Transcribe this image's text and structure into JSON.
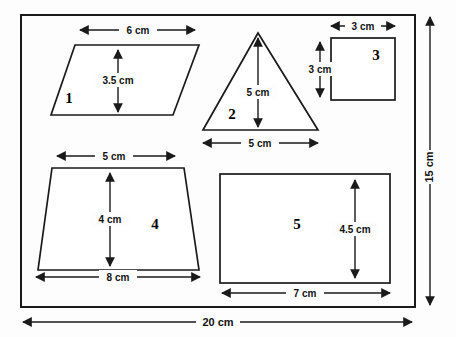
{
  "units": "cm",
  "frame": {
    "name": "outer-bounding-rectangle",
    "width_label": "20 cm",
    "height_label": "15 cm",
    "width_value": 20,
    "height_value": 15
  },
  "shapes": [
    {
      "id": 1,
      "number_label": "1",
      "kind": "parallelogram",
      "dimensions": [
        {
          "name": "base",
          "label": "6 cm",
          "value": 6,
          "orientation": "horizontal"
        },
        {
          "name": "height",
          "label": "3.5 cm",
          "value": 3.5,
          "orientation": "vertical"
        }
      ]
    },
    {
      "id": 2,
      "number_label": "2",
      "kind": "triangle",
      "dimensions": [
        {
          "name": "height",
          "label": "5 cm",
          "value": 5,
          "orientation": "vertical"
        },
        {
          "name": "base",
          "label": "5 cm",
          "value": 5,
          "orientation": "horizontal"
        }
      ]
    },
    {
      "id": 3,
      "number_label": "3",
      "kind": "square",
      "dimensions": [
        {
          "name": "width",
          "label": "3 cm",
          "value": 3,
          "orientation": "horizontal"
        },
        {
          "name": "height",
          "label": "3 cm",
          "value": 3,
          "orientation": "vertical"
        }
      ]
    },
    {
      "id": 4,
      "number_label": "4",
      "kind": "trapezoid",
      "dimensions": [
        {
          "name": "top-base",
          "label": "5 cm",
          "value": 5,
          "orientation": "horizontal"
        },
        {
          "name": "height",
          "label": "4 cm",
          "value": 4,
          "orientation": "vertical"
        },
        {
          "name": "bottom-base",
          "label": "8 cm",
          "value": 8,
          "orientation": "horizontal"
        }
      ]
    },
    {
      "id": 5,
      "number_label": "5",
      "kind": "rectangle",
      "dimensions": [
        {
          "name": "height",
          "label": "4.5 cm",
          "value": 4.5,
          "orientation": "vertical"
        },
        {
          "name": "width",
          "label": "7 cm",
          "value": 7,
          "orientation": "horizontal"
        }
      ]
    }
  ],
  "labels": {
    "shape1_number": "1",
    "shape1_base": "6 cm",
    "shape1_height": "3.5 cm",
    "shape2_number": "2",
    "shape2_height": "5 cm",
    "shape2_base": "5 cm",
    "shape3_number": "3",
    "shape3_width": "3 cm",
    "shape3_height": "3 cm",
    "shape4_number": "4",
    "shape4_top": "5 cm",
    "shape4_height": "4 cm",
    "shape4_bottom": "8 cm",
    "shape5_number": "5",
    "shape5_height": "4.5 cm",
    "shape5_width": "7 cm",
    "frame_height": "15 cm",
    "frame_width": "20 cm"
  },
  "colors": {
    "ink": "#1a1a1a",
    "paper": "#fdfdfd",
    "shape_fill": "#ffffff"
  }
}
